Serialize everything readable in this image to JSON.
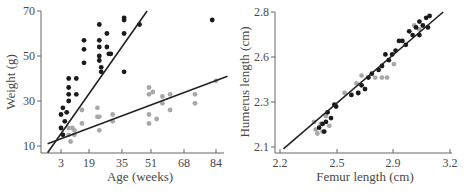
{
  "colors": {
    "dark_points": "#1a1a1a",
    "light_points": "#a8a8a8",
    "axis": "#666666",
    "line": "#222222"
  },
  "chart_data": [
    {
      "type": "scatter",
      "title": "",
      "xlabel": "Age (weeks)",
      "ylabel": "Weight (g)",
      "x_ticks": [
        "3",
        "19",
        "35",
        "51",
        "68",
        "84"
      ],
      "y_ticks": [
        "10",
        "30",
        "50",
        "70"
      ],
      "xlim": [
        -4,
        90
      ],
      "ylim": [
        7,
        70
      ],
      "grid": false,
      "legend": null,
      "series": [
        {
          "name": "dark",
          "color": "#1a1a1a",
          "points": [
            [
              3,
              24
            ],
            [
              3,
              18
            ],
            [
              4,
              27
            ],
            [
              4,
              15
            ],
            [
              5,
              21
            ],
            [
              6,
              25
            ],
            [
              7,
              30
            ],
            [
              7,
              33
            ],
            [
              7,
              36
            ],
            [
              7,
              40
            ],
            [
              11,
              40
            ],
            [
              11,
              33
            ],
            [
              15,
              47
            ],
            [
              15,
              53
            ],
            [
              15,
              57
            ],
            [
              23,
              64
            ],
            [
              23,
              57
            ],
            [
              23,
              54
            ],
            [
              23,
              50
            ],
            [
              23,
              48
            ],
            [
              24,
              45
            ],
            [
              24,
              43
            ],
            [
              27,
              60
            ],
            [
              27,
              54
            ],
            [
              28,
              51
            ],
            [
              29,
              51
            ],
            [
              36,
              67
            ],
            [
              36,
              66
            ],
            [
              36,
              60
            ],
            [
              36,
              43
            ],
            [
              44,
              64
            ],
            [
              82,
              66
            ]
          ]
        },
        {
          "name": "light",
          "color": "#a8a8a8",
          "points": [
            [
              7,
              18
            ],
            [
              7,
              15
            ],
            [
              8,
              12
            ],
            [
              9,
              18
            ],
            [
              10,
              15
            ],
            [
              10,
              17
            ],
            [
              14,
              26
            ],
            [
              14,
              20
            ],
            [
              22,
              27
            ],
            [
              22,
              23
            ],
            [
              23,
              17
            ],
            [
              23,
              23
            ],
            [
              30,
              24
            ],
            [
              30,
              21
            ],
            [
              49,
              36
            ],
            [
              49,
              33
            ],
            [
              49,
              24
            ],
            [
              49,
              20
            ],
            [
              51,
              34
            ],
            [
              53,
              22
            ],
            [
              56,
              32
            ],
            [
              56,
              29
            ],
            [
              60,
              33
            ],
            [
              60,
              26
            ],
            [
              73,
              33
            ],
            [
              73,
              29
            ],
            [
              84,
              39
            ]
          ]
        }
      ],
      "regression_lines": [
        {
          "series": "dark",
          "from": [
            -4,
            7
          ],
          "to": [
            48,
            70
          ]
        },
        {
          "series": "light",
          "from": [
            -4,
            11
          ],
          "to": [
            90,
            41
          ]
        }
      ]
    },
    {
      "type": "scatter",
      "title": "",
      "xlabel": "Femur length (cm)",
      "ylabel": "Humerus length (cm)",
      "x_ticks": [
        "2.2",
        "2.5",
        "2.9",
        "3.2"
      ],
      "y_ticks": [
        "2.1",
        "2.3",
        "2.6",
        "2.8"
      ],
      "xlim": [
        2.17,
        3.2
      ],
      "ylim": [
        2.08,
        2.8
      ],
      "grid": false,
      "legend": null,
      "series": [
        {
          "name": "dark",
          "color": "#1a1a1a",
          "points": [
            [
              2.43,
              2.2
            ],
            [
              2.45,
              2.22
            ],
            [
              2.46,
              2.18
            ],
            [
              2.47,
              2.23
            ],
            [
              2.48,
              2.28
            ],
            [
              2.5,
              2.25
            ],
            [
              2.52,
              2.32
            ],
            [
              2.53,
              2.31
            ],
            [
              2.62,
              2.37
            ],
            [
              2.66,
              2.38
            ],
            [
              2.68,
              2.42
            ],
            [
              2.7,
              2.4
            ],
            [
              2.72,
              2.46
            ],
            [
              2.74,
              2.48
            ],
            [
              2.78,
              2.5
            ],
            [
              2.8,
              2.52
            ],
            [
              2.82,
              2.58
            ],
            [
              2.84,
              2.55
            ],
            [
              2.86,
              2.58
            ],
            [
              2.88,
              2.6
            ],
            [
              2.9,
              2.65
            ],
            [
              2.92,
              2.65
            ],
            [
              2.94,
              2.63
            ],
            [
              2.96,
              2.7
            ],
            [
              2.98,
              2.68
            ],
            [
              3.0,
              2.72
            ],
            [
              3.02,
              2.75
            ],
            [
              3.04,
              2.73
            ],
            [
              3.06,
              2.77
            ],
            [
              3.07,
              2.72
            ],
            [
              3.02,
              2.68
            ],
            [
              3.08,
              2.78
            ]
          ]
        },
        {
          "name": "light",
          "color": "#a8a8a8",
          "points": [
            [
              2.4,
              2.23
            ],
            [
              2.41,
              2.19
            ],
            [
              2.42,
              2.17
            ],
            [
              2.44,
              2.22
            ],
            [
              2.45,
              2.18
            ],
            [
              2.47,
              2.26
            ],
            [
              2.49,
              2.21
            ],
            [
              2.58,
              2.38
            ],
            [
              2.65,
              2.43
            ],
            [
              2.66,
              2.38
            ],
            [
              2.68,
              2.47
            ],
            [
              2.76,
              2.46
            ],
            [
              2.8,
              2.46
            ],
            [
              2.83,
              2.46
            ],
            [
              2.87,
              2.53
            ],
            [
              2.99,
              2.73
            ],
            [
              3.02,
              2.71
            ]
          ]
        }
      ],
      "regression_lines": [
        {
          "series": "all",
          "from": [
            2.22,
            2.09
          ],
          "to": [
            3.16,
            2.8
          ]
        }
      ]
    }
  ]
}
